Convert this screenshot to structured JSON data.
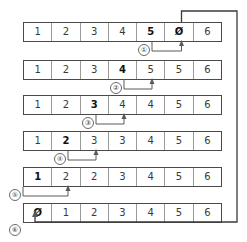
{
  "diagram": {
    "cell_count": 7,
    "accent_color": "#5a5a5a",
    "border_color": "#4a4a4a",
    "rows": [
      {
        "marker": "①",
        "cells": [
          {
            "value": "1",
            "bold": false
          },
          {
            "value": "2",
            "bold": false
          },
          {
            "value": "3",
            "bold": false
          },
          {
            "value": "4",
            "bold": false
          },
          {
            "value": "5",
            "bold": true
          },
          {
            "value": "Ø",
            "bold": true
          },
          {
            "value": "6",
            "bold": false
          }
        ]
      },
      {
        "marker": "②",
        "cells": [
          {
            "value": "1",
            "bold": false
          },
          {
            "value": "2",
            "bold": false
          },
          {
            "value": "3",
            "bold": false
          },
          {
            "value": "4",
            "bold": true
          },
          {
            "value": "5",
            "bold": false
          },
          {
            "value": "5",
            "bold": false
          },
          {
            "value": "6",
            "bold": false
          }
        ]
      },
      {
        "marker": "③",
        "cells": [
          {
            "value": "1",
            "bold": false
          },
          {
            "value": "2",
            "bold": false
          },
          {
            "value": "3",
            "bold": true
          },
          {
            "value": "4",
            "bold": false
          },
          {
            "value": "4",
            "bold": false
          },
          {
            "value": "5",
            "bold": false
          },
          {
            "value": "6",
            "bold": false
          }
        ]
      },
      {
        "marker": "④",
        "cells": [
          {
            "value": "1",
            "bold": false
          },
          {
            "value": "2",
            "bold": true
          },
          {
            "value": "3",
            "bold": false
          },
          {
            "value": "3",
            "bold": false
          },
          {
            "value": "4",
            "bold": false
          },
          {
            "value": "5",
            "bold": false
          },
          {
            "value": "6",
            "bold": false
          }
        ]
      },
      {
        "marker": "⑤",
        "cells": [
          {
            "value": "1",
            "bold": true
          },
          {
            "value": "2",
            "bold": false
          },
          {
            "value": "2",
            "bold": false
          },
          {
            "value": "3",
            "bold": false
          },
          {
            "value": "4",
            "bold": false
          },
          {
            "value": "5",
            "bold": false
          },
          {
            "value": "6",
            "bold": false
          }
        ]
      },
      {
        "marker": "⑥",
        "cells": [
          {
            "value": "Ø",
            "bold": true
          },
          {
            "value": "1",
            "bold": false
          },
          {
            "value": "2",
            "bold": false
          },
          {
            "value": "3",
            "bold": false
          },
          {
            "value": "4",
            "bold": false
          },
          {
            "value": "5",
            "bold": false
          },
          {
            "value": "6",
            "bold": false
          }
        ]
      }
    ]
  }
}
